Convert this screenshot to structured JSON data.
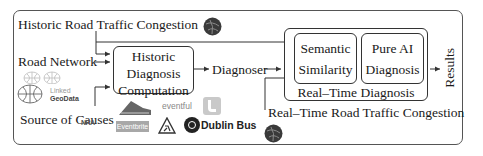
{
  "diagram": {
    "inputs": {
      "historic_congestion": "Historic Road Traffic Congestion",
      "road_network": "Road Network",
      "source_of_causes": "Source of Causes",
      "realtime_congestion": "Real–Time Road Traffic Congestion"
    },
    "components": {
      "historic_diagnosis": [
        "Historic",
        "Diagnosis",
        "Computation"
      ],
      "diagnoser": "Diagnoser",
      "realtime_diagnosis": "Real–Time Diagnosis",
      "semantic_similarity": [
        "Semantic",
        "Similarity"
      ],
      "pure_ai": [
        "Pure AI",
        "Diagnosis"
      ]
    },
    "output": "Results",
    "logos": {
      "linked_geodata_line1": "Linked",
      "linked_geodata_line2": "GeoData",
      "eventful": "eventful",
      "eventbrite": "Eventbrite",
      "dublin_bus": "Dublin Bus",
      "nra": "NRA"
    },
    "colors": {
      "line": "#333333",
      "globe": "#3a3a3a",
      "twitter": "#bdbdbd"
    }
  }
}
